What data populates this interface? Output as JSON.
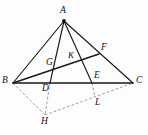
{
  "figure": {
    "background_color": "#fdfdfd",
    "solid_stroke_color": "#1a1a1a",
    "dashed_stroke_color": "#8a8a8a",
    "label_color": "#121212"
  },
  "labels": {
    "A": "A",
    "B": "B",
    "C": "C",
    "D": "D",
    "E": "E",
    "F": "F",
    "G": "G",
    "H": "H",
    "K": "K",
    "L": "L"
  },
  "points": {
    "A": {
      "x": 64,
      "y": 21
    },
    "B": {
      "x": 13,
      "y": 83
    },
    "C": {
      "x": 133,
      "y": 83
    },
    "D": {
      "x": 50,
      "y": 83
    },
    "E": {
      "x": 92,
      "y": 83
    },
    "F": {
      "x": 99,
      "y": 54
    },
    "G": {
      "x": 56,
      "y": 67
    },
    "H": {
      "x": 45,
      "y": 115
    },
    "K": {
      "x": 72,
      "y": 61
    },
    "L": {
      "x": 95,
      "y": 97
    }
  },
  "label_positions": {
    "A": {
      "x": 60,
      "y": 6
    },
    "B": {
      "x": 2,
      "y": 76
    },
    "C": {
      "x": 136,
      "y": 76
    },
    "D": {
      "x": 42,
      "y": 84
    },
    "E": {
      "x": 94,
      "y": 71
    },
    "F": {
      "x": 101,
      "y": 43
    },
    "G": {
      "x": 46,
      "y": 58
    },
    "H": {
      "x": 41,
      "y": 117
    },
    "K": {
      "x": 68,
      "y": 51
    },
    "L": {
      "x": 95,
      "y": 98
    }
  },
  "segments": {
    "solid": [
      {
        "name": "side-AB",
        "from": "A",
        "to": "B"
      },
      {
        "name": "side-AC",
        "from": "A",
        "to": "C"
      },
      {
        "name": "side-BC",
        "from": "B",
        "to": "C"
      },
      {
        "name": "cevian-AD",
        "from": "A",
        "to": "D"
      },
      {
        "name": "cevian-AE",
        "from": "A",
        "to": "E"
      },
      {
        "name": "cevian-BF",
        "from": "B",
        "to": "F"
      }
    ],
    "dashed": [
      {
        "name": "segment-BH",
        "from": "B",
        "to": "H"
      },
      {
        "name": "segment-HC",
        "from": "H",
        "to": "C"
      },
      {
        "name": "segment-DH",
        "from": "D",
        "to": "H"
      },
      {
        "name": "segment-EL",
        "from": "E",
        "to": "L"
      }
    ]
  }
}
